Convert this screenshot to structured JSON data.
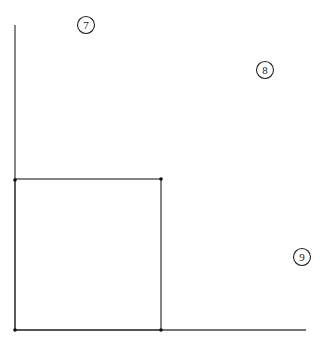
{
  "diagram": {
    "labels": [
      {
        "id": "region-7",
        "text": "7",
        "cx": 86,
        "cy": 25
      },
      {
        "id": "region-8",
        "text": "8",
        "cx": 265,
        "cy": 70
      },
      {
        "id": "region-9",
        "text": "9",
        "cx": 302,
        "cy": 257
      }
    ],
    "colors": {
      "stroke": "#333333",
      "background": "#ffffff"
    }
  }
}
